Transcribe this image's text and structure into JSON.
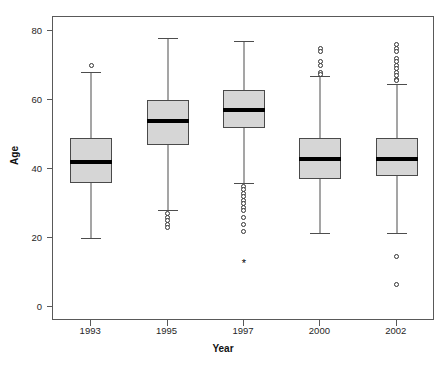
{
  "chart_data": {
    "type": "box",
    "title": "",
    "xlabel": "Year",
    "ylabel": "Age",
    "categories": [
      "1993",
      "1995",
      "1997",
      "2000",
      "2002"
    ],
    "ylim": [
      -4,
      84
    ],
    "yticks": [
      0,
      20,
      40,
      60,
      80
    ],
    "grid": false,
    "legend": null,
    "boxes": [
      {
        "category": "1993",
        "whisker_low": 20.0,
        "q1": 36.0,
        "median": 42.0,
        "q3": 49.0,
        "whisker_high": 68.0,
        "outliers": [
          70.0
        ],
        "extremes": []
      },
      {
        "category": "1995",
        "whisker_low": 28.0,
        "q1": 47.0,
        "median": 54.0,
        "q3": 60.0,
        "whisker_high": 78.0,
        "outliers": [
          27.0,
          26.0,
          25.0,
          24.0,
          23.0
        ],
        "extremes": []
      },
      {
        "category": "1997",
        "whisker_low": 36.0,
        "q1": 52.0,
        "median": 57.0,
        "q3": 63.0,
        "whisker_high": 77.0,
        "outliers": [
          35.0,
          34.0,
          33.0,
          32.0,
          31.0,
          30.0,
          29.0,
          28.0,
          26.0,
          24.0,
          22.0
        ],
        "extremes": [
          12.0
        ]
      },
      {
        "category": "2000",
        "whisker_low": 21.5,
        "q1": 37.0,
        "median": 43.0,
        "q3": 49.0,
        "whisker_high": 67.0,
        "outliers": [
          75.0,
          74.0,
          71.0,
          70.0,
          68.0,
          67.5
        ],
        "extremes": []
      },
      {
        "category": "2002",
        "whisker_low": 21.5,
        "q1": 38.0,
        "median": 43.0,
        "q3": 49.0,
        "whisker_high": 64.5,
        "outliers": [
          76.0,
          75.0,
          74.0,
          72.0,
          71.0,
          70.0,
          69.0,
          68.0,
          67.0,
          66.0,
          65.5,
          14.8,
          6.5
        ],
        "extremes": []
      }
    ]
  },
  "axes": {
    "y_title": "Age",
    "x_title": "Year",
    "y_tick_labels": [
      "80",
      "60",
      "40",
      "20",
      "0"
    ],
    "x_tick_labels": [
      "1993",
      "1995",
      "1997",
      "2000",
      "2002"
    ]
  },
  "colors": {
    "box_fill": "#d6d6d6",
    "box_border": "#4a4a4a",
    "median": "#000000",
    "whisker": "#4d4d4d",
    "frame": "#595959",
    "background": "#ffffff"
  }
}
